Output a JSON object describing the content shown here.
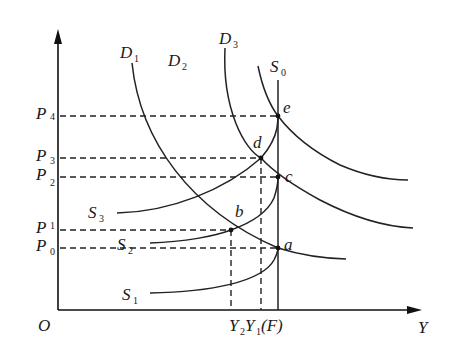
{
  "diagram": {
    "axes": {
      "origin": "O",
      "x_label": "Y",
      "y_label": ""
    },
    "price_levels": [
      {
        "base": "P",
        "sub": "4",
        "y": 116
      },
      {
        "base": "P",
        "sub": "3",
        "y": 158
      },
      {
        "base": "P",
        "sub": "2",
        "y": 177
      },
      {
        "base": "P",
        "sub": "1",
        "y": 230
      },
      {
        "base": "P",
        "sub": "0",
        "y": 248
      }
    ],
    "output_labels": {
      "y2_base": "Y",
      "y2_sub": "2",
      "y1_base": "Y",
      "y1_sub": "1",
      "full": "(F)"
    },
    "demand_labels": [
      {
        "base": "D",
        "sub": "1"
      },
      {
        "base": "D",
        "sub": "2"
      },
      {
        "base": "D",
        "sub": "3"
      }
    ],
    "supply_labels": [
      {
        "base": "S",
        "sub": "0"
      },
      {
        "base": "S",
        "sub": "1"
      },
      {
        "base": "S",
        "sub": "2"
      },
      {
        "base": "S",
        "sub": "3"
      }
    ],
    "points": [
      {
        "name": "a",
        "x": 278,
        "y": 248
      },
      {
        "name": "b",
        "x": 231,
        "y": 230
      },
      {
        "name": "c",
        "x": 278,
        "y": 177
      },
      {
        "name": "d",
        "x": 261,
        "y": 158
      },
      {
        "name": "e",
        "x": 278,
        "y": 116
      }
    ]
  }
}
